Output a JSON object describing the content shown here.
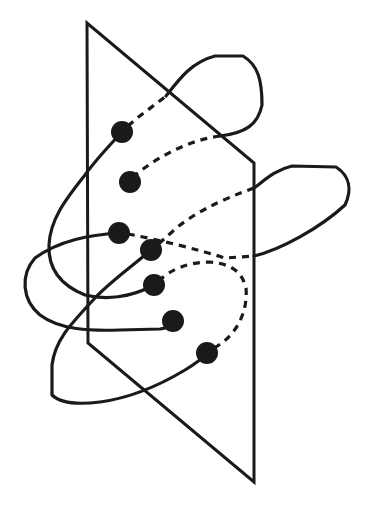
{
  "diagram": {
    "colors": {
      "ink": "#1a1a1a",
      "background": "#ffffff"
    },
    "plane": {
      "points": "87,23 88,343 254,482 254,163"
    },
    "dots": [
      {
        "id": "dot-1",
        "cx": 122,
        "cy": 132,
        "r": 11
      },
      {
        "id": "dot-2",
        "cx": 130,
        "cy": 182,
        "r": 11
      },
      {
        "id": "dot-3",
        "cx": 119,
        "cy": 233,
        "r": 11
      },
      {
        "id": "dot-4",
        "cx": 151,
        "cy": 250,
        "r": 11
      },
      {
        "id": "dot-5",
        "cx": 154,
        "cy": 285,
        "r": 11
      },
      {
        "id": "dot-6",
        "cx": 173,
        "cy": 321,
        "r": 11
      },
      {
        "id": "dot-7",
        "cx": 207,
        "cy": 353,
        "r": 11
      }
    ],
    "strands": {
      "solid": [
        {
          "id": "strand-a-front",
          "d": "M122,132 C105,150 92,165 85,175 C65,200 50,220 49,245 C48,268 60,285 85,295 C105,300 130,298 154,285"
        },
        {
          "id": "strand-a-loop-top",
          "d": "M166,96 C180,78 192,62 215,56 L243,56 C258,65 262,80 262,105 C258,125 245,133 220,136"
        },
        {
          "id": "strand-b-front",
          "d": "M119,233 C90,235 60,240 35,258 C20,275 22,300 40,315 C60,330 90,331 120,330 L160,329 C168,328 172,325 173,321"
        },
        {
          "id": "strand-b-loop-right",
          "d": "M254,256 C280,250 320,228 345,205 C352,190 350,176 336,167 L292,166 C275,170 265,180 254,188"
        },
        {
          "id": "strand-c-front",
          "d": "M151,250 C130,268 110,282 95,298 C70,325 55,340 52,365 L52,395 C60,403 75,405 100,402 C130,398 160,385 185,370 C195,364 202,359 207,353"
        }
      ],
      "dashed": [
        {
          "id": "strand-a-hidden-1",
          "d": "M128,126 C140,115 155,105 166,96"
        },
        {
          "id": "strand-a-hidden-2",
          "d": "M220,136 C190,140 160,155 134,176"
        },
        {
          "id": "strand-b-hidden-1",
          "d": "M128,234 C160,240 200,250 225,258 L254,256"
        },
        {
          "id": "strand-b-hidden-2",
          "d": "M254,188 C220,200 190,215 172,232 C165,238 160,243 156,246"
        },
        {
          "id": "strand-c-hidden",
          "d": "M214,348 C238,335 248,310 246,288 C242,272 232,264 210,262 C188,262 170,270 160,280"
        }
      ]
    }
  }
}
